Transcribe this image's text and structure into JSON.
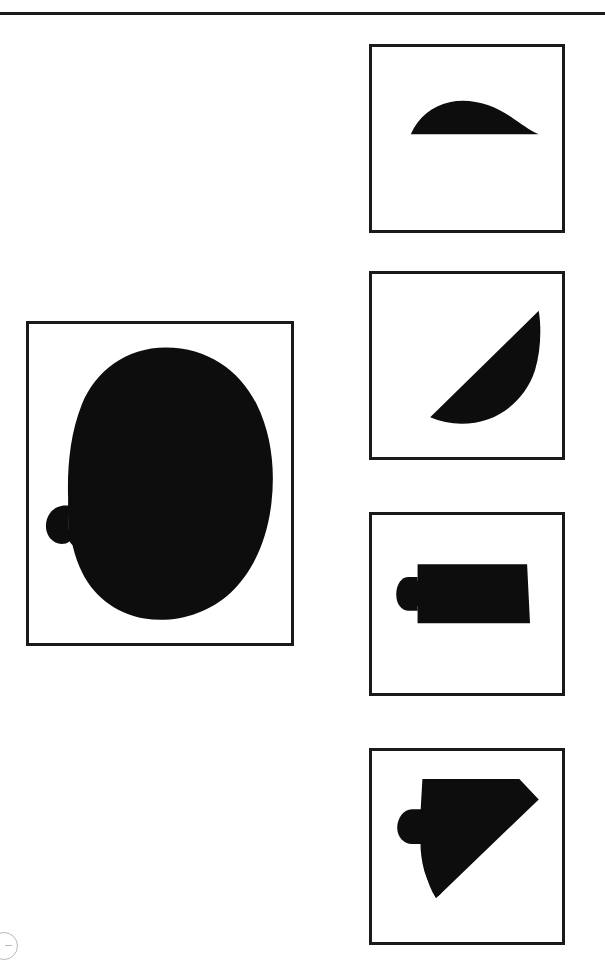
{
  "sheet": {
    "title": "Patent Drawing Sheet",
    "background_color": "#ffffff",
    "ink_color": "#0d0d0d",
    "border_color": "#1a1a1a",
    "width": 605,
    "height": 963,
    "header_rule_label": "header-rule"
  },
  "corner_mark": {
    "label": "partial-circle-registration-mark",
    "color": "#b9b9b9"
  },
  "figures": [
    {
      "id": "fig-main",
      "caption": "",
      "name": "main-elevation-view",
      "description": "Large solid rounded organic body with small rounded nub protruding at left side",
      "frame": {
        "x": 26,
        "y": 321,
        "w": 268,
        "h": 325
      },
      "shape": "blob-with-left-nub"
    },
    {
      "id": "fig-1",
      "caption": "",
      "name": "thin-crescent-section-view",
      "description": "Thin shallow dome crescent with flat bottom edge",
      "frame": {
        "x": 369,
        "y": 44,
        "w": 196,
        "h": 189
      },
      "shape": "shallow-dome"
    },
    {
      "id": "fig-2",
      "caption": "",
      "name": "diagonal-half-moon-section-view",
      "description": "Diagonal half moon lune oriented lower-left to upper-right",
      "frame": {
        "x": 369,
        "y": 271,
        "w": 196,
        "h": 189
      },
      "shape": "diagonal-lune"
    },
    {
      "id": "fig-3",
      "caption": "",
      "name": "rectangular-section-view",
      "description": "Rectangle with small rounded nub protruding at left side",
      "frame": {
        "x": 369,
        "y": 512,
        "w": 196,
        "h": 184
      },
      "shape": "rect-with-left-nub"
    },
    {
      "id": "fig-4",
      "caption": "",
      "name": "bevelled-section-view",
      "description": "Quadrant shape with diagonal bevel on lower right and small rounded nub at left side",
      "frame": {
        "x": 369,
        "y": 748,
        "w": 196,
        "h": 197
      },
      "shape": "bevelled-with-left-nub"
    }
  ]
}
